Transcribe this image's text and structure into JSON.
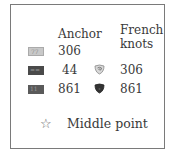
{
  "legend": {
    "headers": {
      "anchor": "Anchor",
      "french_knots_line1": "French",
      "french_knots_line2": "knots"
    },
    "rows": [
      {
        "swatch_symbol": "77",
        "swatch_color": "#c8c8c8",
        "anchor": "306",
        "knot": null
      },
      {
        "swatch_symbol": "==",
        "swatch_color": "#4a4a4a",
        "anchor": "44",
        "knot": {
          "icon": "french-knot-light-icon",
          "color": "#9a9a9a",
          "anchor": "306"
        }
      },
      {
        "swatch_symbol": "11",
        "swatch_color": "#5a5a5a",
        "anchor": "861",
        "knot": {
          "icon": "french-knot-dark-icon",
          "color": "#3a3a3a",
          "anchor": "861"
        }
      }
    ],
    "middle_point": {
      "icon": "star-outline-icon",
      "glyph": "☆",
      "label": "Middle point"
    }
  }
}
